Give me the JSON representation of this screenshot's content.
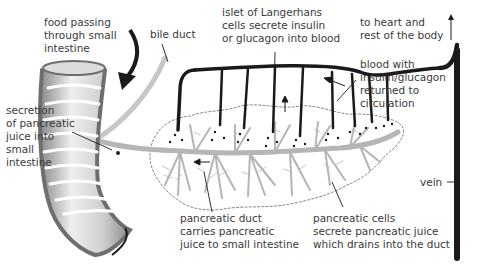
{
  "diagram": {
    "colors": {
      "vessel": "#1a1a1a",
      "duct": "#b5b5b5",
      "intestine_dark": "#6e6e6e",
      "intestine_light": "#e6e6e6",
      "text": "#3a3a3a",
      "background": "#ffffff"
    },
    "labels": {
      "food": [
        "food passing",
        "through small",
        "intestine"
      ],
      "bile_duct": [
        "bile duct"
      ],
      "islet": [
        "islet of Langerhans",
        "cells secrete insulin",
        "or glucagon into blood"
      ],
      "heart": [
        "to heart and",
        "rest of the body"
      ],
      "blood_return": [
        "blood with",
        "insulin/glucagon",
        "returned to",
        "circulation"
      ],
      "secretion": [
        "secretion",
        "of pancreatic",
        "juice into",
        "small",
        "intestine"
      ],
      "vein": [
        "vein"
      ],
      "pancreatic_duct": [
        "pancreatic duct",
        "carries pancreatic",
        "juice to small intestine"
      ],
      "pancreatic_cells": [
        "pancreatic cells",
        "secrete pancreatic juice",
        "which drains into the duct"
      ]
    }
  }
}
